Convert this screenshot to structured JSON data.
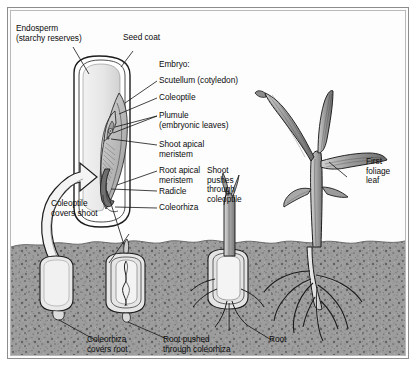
{
  "figure": {
    "border_color": "#8d8d8d",
    "background": "#fdfdfd",
    "soil_color": "#9a9a9a",
    "soil_top_y": 240
  },
  "labels": {
    "endosperm": "Endosperm\n(starchy reserves)",
    "seed_coat": "Seed coat",
    "embryo": "Embryo:",
    "scutellum": "Scutellum (cotyledon)",
    "coleoptile": "Coleoptile",
    "plumule": "Plumule\n(embryonic leaves)",
    "shoot_apical_meristem": "Shoot apical\nmeristem",
    "root_apical_meristem": "Root apical\nmeristem",
    "radicle": "Radicle",
    "coleorhiza": "Coleorhiza",
    "coleoptile_covers_shoot": "Coleoptile\ncovers shoot",
    "shoot_pushes_through_coleoptile": "Shoot\npushes\nthrough\ncoleoptile",
    "first_foliage_leaf": "First\nfoliage\nleaf",
    "coleorhiza_covers_root": "Coleorhiza\ncovers root",
    "root_pushed_through_coleorhiza": "Root pushed\nthrough coleorhiza",
    "root": "Root"
  },
  "structures": {
    "seed_cutaway": "enlarged longitudinal section of grain",
    "stage_1": "ungerminated seed in soil",
    "stage_2": "seed with coleoptile and coleorhiza emerging",
    "stage_3": "seed with shoot through coleoptile and roots through coleorhiza",
    "stage_4": "established seedling with foliage leaves and fibrous roots"
  }
}
